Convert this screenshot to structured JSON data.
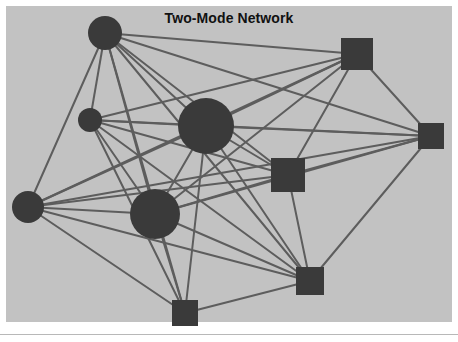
{
  "figure": {
    "title": "Two-Mode Network",
    "width": 458,
    "height": 342,
    "outer_background": "#ffffff",
    "plot_background": "#c2c2c2",
    "plot_rect": {
      "x": 6,
      "y": 6,
      "width": 446,
      "height": 316
    },
    "footer_rule": {
      "x": 0,
      "y": 334,
      "width": 458,
      "height": 1,
      "color": "#b8b8b8"
    }
  },
  "style": {
    "node_color": "#3a3a3a",
    "edge_color": "#5d5d5d",
    "edge_width": 2,
    "title_color": "#111111",
    "title_font_size": 14
  },
  "chart_data": {
    "type": "diagram",
    "subtype": "two-mode-network",
    "title": "Two-Mode Network",
    "xlabel": "",
    "ylabel": "",
    "grid": false,
    "legend": "none",
    "modes": [
      {
        "name": "mode-1",
        "shape": "circle",
        "count": 5
      },
      {
        "name": "mode-2",
        "shape": "square",
        "count": 5
      }
    ],
    "nodes": [
      {
        "id": "c1",
        "mode": "mode-1",
        "shape": "circle",
        "x": 105,
        "y": 33,
        "size": 17,
        "label": ""
      },
      {
        "id": "c2",
        "mode": "mode-1",
        "shape": "circle",
        "x": 90,
        "y": 120,
        "size": 12,
        "label": ""
      },
      {
        "id": "c3",
        "mode": "mode-1",
        "shape": "circle",
        "x": 206,
        "y": 126,
        "size": 28,
        "label": ""
      },
      {
        "id": "c4",
        "mode": "mode-1",
        "shape": "circle",
        "x": 28,
        "y": 207,
        "size": 16,
        "label": ""
      },
      {
        "id": "c5",
        "mode": "mode-1",
        "shape": "circle",
        "x": 155,
        "y": 214,
        "size": 25,
        "label": ""
      },
      {
        "id": "s1",
        "mode": "mode-2",
        "shape": "square",
        "x": 357,
        "y": 54,
        "size": 16,
        "label": ""
      },
      {
        "id": "s2",
        "mode": "mode-2",
        "shape": "square",
        "x": 431,
        "y": 136,
        "size": 13,
        "label": ""
      },
      {
        "id": "s3",
        "mode": "mode-2",
        "shape": "square",
        "x": 288,
        "y": 175,
        "size": 17,
        "label": ""
      },
      {
        "id": "s4",
        "mode": "mode-2",
        "shape": "square",
        "x": 310,
        "y": 281,
        "size": 14,
        "label": ""
      },
      {
        "id": "s5",
        "mode": "mode-2",
        "shape": "square",
        "x": 185,
        "y": 313,
        "size": 13,
        "label": ""
      }
    ],
    "edges": [
      {
        "source": "c1",
        "target": "s1"
      },
      {
        "source": "c1",
        "target": "s2"
      },
      {
        "source": "c1",
        "target": "s3"
      },
      {
        "source": "c1",
        "target": "s4"
      },
      {
        "source": "c1",
        "target": "s5"
      },
      {
        "source": "c2",
        "target": "s1"
      },
      {
        "source": "c2",
        "target": "s2"
      },
      {
        "source": "c2",
        "target": "s3"
      },
      {
        "source": "c2",
        "target": "s4"
      },
      {
        "source": "c2",
        "target": "s5"
      },
      {
        "source": "c3",
        "target": "s1"
      },
      {
        "source": "c3",
        "target": "s2"
      },
      {
        "source": "c3",
        "target": "s3"
      },
      {
        "source": "c3",
        "target": "s4"
      },
      {
        "source": "c3",
        "target": "s5"
      },
      {
        "source": "c4",
        "target": "s1"
      },
      {
        "source": "c4",
        "target": "s2"
      },
      {
        "source": "c4",
        "target": "s3"
      },
      {
        "source": "c4",
        "target": "s4"
      },
      {
        "source": "c4",
        "target": "s5"
      },
      {
        "source": "c5",
        "target": "s1"
      },
      {
        "source": "c5",
        "target": "s2"
      },
      {
        "source": "c5",
        "target": "s3"
      },
      {
        "source": "c5",
        "target": "s4"
      },
      {
        "source": "c5",
        "target": "s5"
      },
      {
        "source": "c1",
        "target": "c2"
      },
      {
        "source": "c1",
        "target": "c3"
      },
      {
        "source": "c1",
        "target": "c4"
      },
      {
        "source": "c1",
        "target": "c5"
      },
      {
        "source": "c2",
        "target": "c3"
      },
      {
        "source": "c2",
        "target": "c5"
      },
      {
        "source": "c3",
        "target": "c4"
      },
      {
        "source": "c3",
        "target": "c5"
      },
      {
        "source": "c4",
        "target": "c5"
      },
      {
        "source": "s1",
        "target": "s2"
      },
      {
        "source": "s1",
        "target": "s3"
      },
      {
        "source": "s2",
        "target": "s3"
      },
      {
        "source": "s2",
        "target": "s4"
      },
      {
        "source": "s3",
        "target": "s4"
      },
      {
        "source": "s4",
        "target": "s5"
      }
    ]
  }
}
